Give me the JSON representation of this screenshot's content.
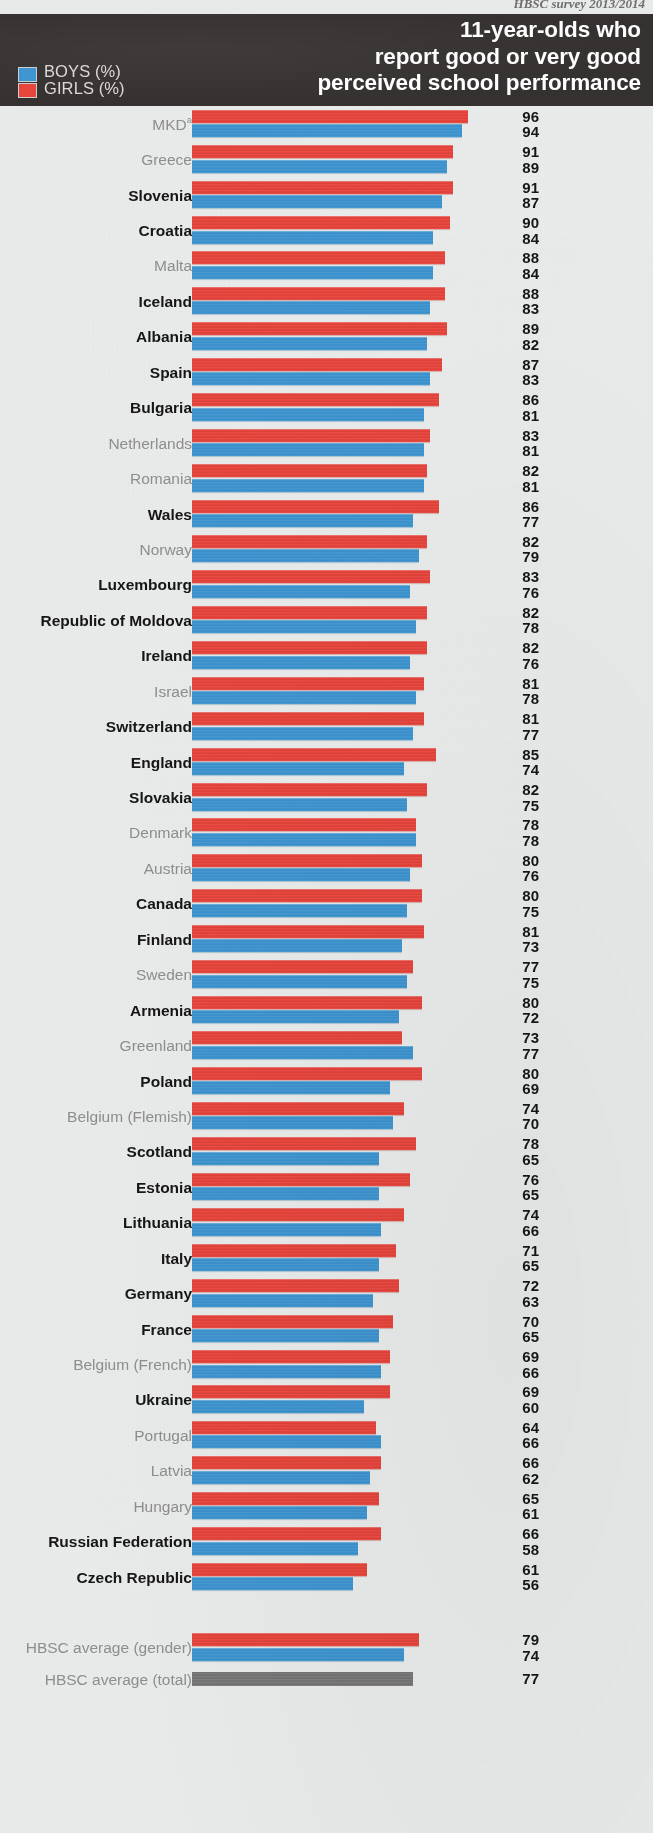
{
  "running_head": "HBSC survey 2013/2014",
  "header": {
    "title_lines": [
      "11-year-olds who",
      "report good or very good",
      "perceived school performance"
    ],
    "legend": [
      {
        "key": "boys",
        "label": "BOYS (%)",
        "color": "#3f96d2"
      },
      {
        "key": "girls",
        "label": "GIRLS (%)",
        "color": "#e8453c"
      }
    ]
  },
  "colors": {
    "boys": "#3f96d2",
    "girls": "#e8453c",
    "total": "#767676",
    "header_background": "#332f2e",
    "page_background": "#e9eaea",
    "label_significant": "#161616",
    "label_regular": "#8e8e8e"
  },
  "chart_data": {
    "type": "bar",
    "orientation": "horizontal",
    "title": "11-year-olds who report good or very good perceived school performance",
    "subtitle": "HBSC survey 2013/2014",
    "xlabel": "",
    "ylabel": "",
    "xlim": [
      0,
      100
    ],
    "grid": false,
    "legend_position": "top-left",
    "value_unit": "%",
    "series": [
      {
        "name": "GIRLS (%)",
        "color": "#e8453c"
      },
      {
        "name": "BOYS (%)",
        "color": "#3f96d2"
      }
    ],
    "sorted_by": "girls descending (approximately)",
    "bold_label_meaning": "bold country label indicates significant gender difference",
    "categories": [
      "MKD",
      "Greece",
      "Slovenia",
      "Croatia",
      "Malta",
      "Iceland",
      "Albania",
      "Spain",
      "Bulgaria",
      "Netherlands",
      "Romania",
      "Wales",
      "Norway",
      "Luxembourg",
      "Republic of Moldova",
      "Ireland",
      "Israel",
      "Switzerland",
      "England",
      "Slovakia",
      "Denmark",
      "Austria",
      "Canada",
      "Finland",
      "Sweden",
      "Armenia",
      "Greenland",
      "Poland",
      "Belgium (Flemish)",
      "Scotland",
      "Estonia",
      "Lithuania",
      "Italy",
      "Germany",
      "France",
      "Belgium (French)",
      "Ukraine",
      "Portugal",
      "Latvia",
      "Hungary",
      "Russian Federation",
      "Czech Republic"
    ],
    "girls": [
      96,
      91,
      91,
      90,
      88,
      88,
      89,
      87,
      86,
      83,
      82,
      86,
      82,
      83,
      82,
      82,
      81,
      81,
      85,
      82,
      78,
      80,
      80,
      81,
      77,
      80,
      73,
      80,
      74,
      78,
      76,
      74,
      71,
      72,
      70,
      69,
      69,
      64,
      66,
      65,
      66,
      61
    ],
    "boys": [
      94,
      89,
      87,
      84,
      84,
      83,
      82,
      83,
      81,
      81,
      81,
      77,
      79,
      76,
      78,
      76,
      78,
      77,
      74,
      75,
      78,
      76,
      75,
      73,
      75,
      72,
      77,
      69,
      70,
      65,
      65,
      66,
      65,
      63,
      65,
      66,
      60,
      66,
      62,
      61,
      58,
      56
    ],
    "averages": [
      {
        "label": "HBSC average (gender)",
        "girls": 79,
        "boys": 74
      },
      {
        "label": "HBSC average (total)",
        "total": 77
      }
    ]
  },
  "rows": [
    {
      "label": "MKD",
      "footnote": "a",
      "significant": false,
      "girls": 96,
      "boys": 94
    },
    {
      "label": "Greece",
      "significant": false,
      "girls": 91,
      "boys": 89
    },
    {
      "label": "Slovenia",
      "significant": true,
      "girls": 91,
      "boys": 87
    },
    {
      "label": "Croatia",
      "significant": true,
      "girls": 90,
      "boys": 84
    },
    {
      "label": "Malta",
      "significant": false,
      "girls": 88,
      "boys": 84
    },
    {
      "label": "Iceland",
      "significant": true,
      "girls": 88,
      "boys": 83
    },
    {
      "label": "Albania",
      "significant": true,
      "girls": 89,
      "boys": 82
    },
    {
      "label": "Spain",
      "significant": true,
      "girls": 87,
      "boys": 83
    },
    {
      "label": "Bulgaria",
      "significant": true,
      "girls": 86,
      "boys": 81
    },
    {
      "label": "Netherlands",
      "significant": false,
      "girls": 83,
      "boys": 81
    },
    {
      "label": "Romania",
      "significant": false,
      "girls": 82,
      "boys": 81
    },
    {
      "label": "Wales",
      "significant": true,
      "girls": 86,
      "boys": 77
    },
    {
      "label": "Norway",
      "significant": false,
      "girls": 82,
      "boys": 79
    },
    {
      "label": "Luxembourg",
      "significant": true,
      "girls": 83,
      "boys": 76
    },
    {
      "label": "Republic of Moldova",
      "significant": true,
      "girls": 82,
      "boys": 78
    },
    {
      "label": "Ireland",
      "significant": true,
      "girls": 82,
      "boys": 76
    },
    {
      "label": "Israel",
      "significant": false,
      "girls": 81,
      "boys": 78
    },
    {
      "label": "Switzerland",
      "significant": true,
      "girls": 81,
      "boys": 77
    },
    {
      "label": "England",
      "significant": true,
      "girls": 85,
      "boys": 74
    },
    {
      "label": "Slovakia",
      "significant": true,
      "girls": 82,
      "boys": 75
    },
    {
      "label": "Denmark",
      "significant": false,
      "girls": 78,
      "boys": 78
    },
    {
      "label": "Austria",
      "significant": false,
      "girls": 80,
      "boys": 76
    },
    {
      "label": "Canada",
      "significant": true,
      "girls": 80,
      "boys": 75
    },
    {
      "label": "Finland",
      "significant": true,
      "girls": 81,
      "boys": 73
    },
    {
      "label": "Sweden",
      "significant": false,
      "girls": 77,
      "boys": 75
    },
    {
      "label": "Armenia",
      "significant": true,
      "girls": 80,
      "boys": 72
    },
    {
      "label": "Greenland",
      "significant": false,
      "girls": 73,
      "boys": 77
    },
    {
      "label": "Poland",
      "significant": true,
      "girls": 80,
      "boys": 69
    },
    {
      "label": "Belgium (Flemish)",
      "significant": false,
      "girls": 74,
      "boys": 70
    },
    {
      "label": "Scotland",
      "significant": true,
      "girls": 78,
      "boys": 65
    },
    {
      "label": "Estonia",
      "significant": true,
      "girls": 76,
      "boys": 65
    },
    {
      "label": "Lithuania",
      "significant": true,
      "girls": 74,
      "boys": 66
    },
    {
      "label": "Italy",
      "significant": true,
      "girls": 71,
      "boys": 65
    },
    {
      "label": "Germany",
      "significant": true,
      "girls": 72,
      "boys": 63
    },
    {
      "label": "France",
      "significant": true,
      "girls": 70,
      "boys": 65
    },
    {
      "label": "Belgium (French)",
      "significant": false,
      "girls": 69,
      "boys": 66
    },
    {
      "label": "Ukraine",
      "significant": true,
      "girls": 69,
      "boys": 60
    },
    {
      "label": "Portugal",
      "significant": false,
      "girls": 64,
      "boys": 66
    },
    {
      "label": "Latvia",
      "significant": false,
      "girls": 66,
      "boys": 62
    },
    {
      "label": "Hungary",
      "significant": false,
      "girls": 65,
      "boys": 61
    },
    {
      "label": "Russian Federation",
      "significant": true,
      "girls": 66,
      "boys": 58
    },
    {
      "label": "Czech Republic",
      "significant": true,
      "girls": 61,
      "boys": 56
    }
  ],
  "average_rows": [
    {
      "label": "HBSC average (gender)",
      "type": "gender",
      "girls": 79,
      "boys": 74
    },
    {
      "label": "HBSC average (total)",
      "type": "total",
      "total": 77
    }
  ]
}
